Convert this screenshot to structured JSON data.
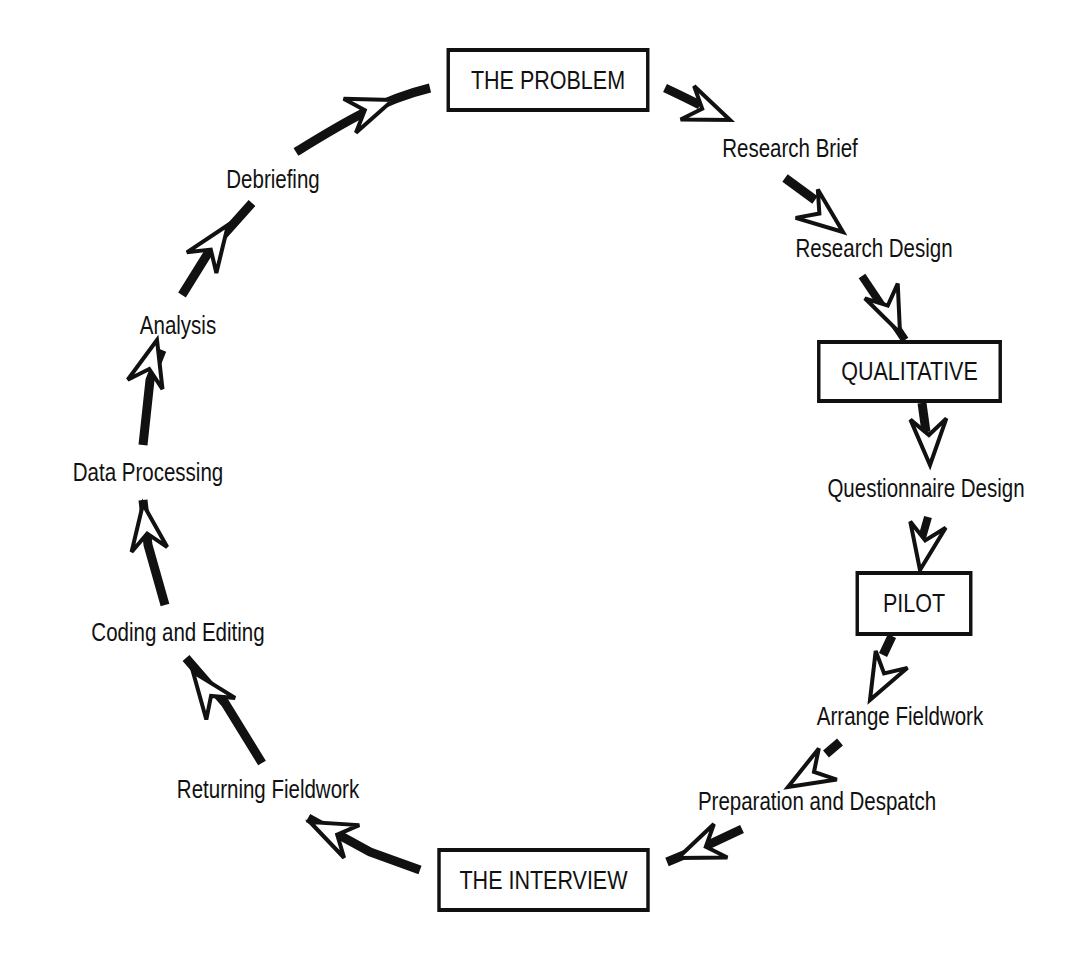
{
  "diagram": {
    "type": "cycle",
    "colors": {
      "ink": "#111111",
      "background": "#ffffff"
    },
    "boxes": {
      "problem": "THE PROBLEM",
      "qualitative": "QUALITATIVE",
      "pilot": "PILOT",
      "interview": "THE INTERVIEW"
    },
    "labels": {
      "research_brief": "Research Brief",
      "research_design": "Research Design",
      "questionnaire_design": "Questionnaire Design",
      "arrange_fieldwork": "Arrange Fieldwork",
      "preparation_despatch": "Preparation and Despatch",
      "returning_fieldwork": "Returning Fieldwork",
      "coding_editing": "Coding and Editing",
      "data_processing": "Data Processing",
      "analysis": "Analysis",
      "debriefing": "Debriefing"
    },
    "sequence": [
      "THE PROBLEM",
      "Research Brief",
      "Research Design",
      "QUALITATIVE",
      "Questionnaire Design",
      "PILOT",
      "Arrange Fieldwork",
      "Preparation and Despatch",
      "THE INTERVIEW",
      "Returning Fieldwork",
      "Coding and Editing",
      "Data Processing",
      "Analysis",
      "Debriefing"
    ],
    "arrow_icon": "hollow-arrowhead-icon"
  }
}
